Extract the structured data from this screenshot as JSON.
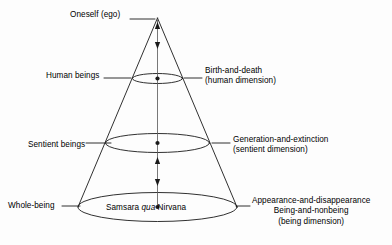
{
  "diagram": {
    "type": "cone-hierarchy-diagram",
    "background_color": "#fdfdfd",
    "stroke_color": "#1a1a1a",
    "apex": {
      "label": "Oneself (ego)"
    },
    "levels": [
      {
        "left_label": "Human beings",
        "right_label_line1": "Birth-and-death",
        "right_label_line2": "(human dimension)"
      },
      {
        "left_label": "Sentient beings",
        "right_label_line1": "Generation-and-extinction",
        "right_label_line2": "(sentient dimension)"
      },
      {
        "left_label": "Whole-being",
        "right_label_line1": "Appearance-and-disappearance",
        "right_label_line2": "Being-and-nonbeing",
        "right_label_line3": "(being dimension)"
      }
    ],
    "base_inscription": {
      "word1": "Samsara",
      "word2_italic": "qua",
      "word3": "Nirvana"
    }
  }
}
